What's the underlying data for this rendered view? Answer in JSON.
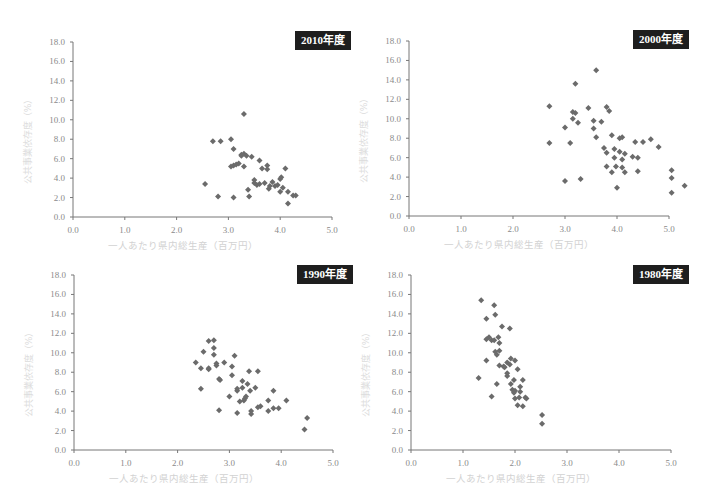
{
  "chart_data": [
    {
      "type": "scatter",
      "title": "2010年度",
      "xlabel": "一人あたり県内総生産（百万円）",
      "ylabel": "公共事業依存度（%）",
      "xlim": [
        0,
        5
      ],
      "ylim": [
        0,
        18
      ],
      "xticks": [
        "0.0",
        "1.0",
        "2.0",
        "3.0",
        "4.0",
        "5.0"
      ],
      "yticks": [
        "0.0",
        "2.0",
        "4.0",
        "6.0",
        "8.0",
        "10.0",
        "12.0",
        "14.0",
        "16.0",
        "18.0"
      ],
      "grid": false,
      "points": [
        [
          2.55,
          3.4
        ],
        [
          2.7,
          7.8
        ],
        [
          2.8,
          2.1
        ],
        [
          2.85,
          7.8
        ],
        [
          3.05,
          8.0
        ],
        [
          3.05,
          5.2
        ],
        [
          3.1,
          5.3
        ],
        [
          3.1,
          7.0
        ],
        [
          3.1,
          2.0
        ],
        [
          3.15,
          5.4
        ],
        [
          3.2,
          5.5
        ],
        [
          3.25,
          6.4
        ],
        [
          3.25,
          6.3
        ],
        [
          3.3,
          5.2
        ],
        [
          3.3,
          10.6
        ],
        [
          3.3,
          6.5
        ],
        [
          3.35,
          6.3
        ],
        [
          3.38,
          2.8
        ],
        [
          3.4,
          2.1
        ],
        [
          3.45,
          6.2
        ],
        [
          3.5,
          3.8
        ],
        [
          3.5,
          3.5
        ],
        [
          3.55,
          3.3
        ],
        [
          3.6,
          5.8
        ],
        [
          3.6,
          3.4
        ],
        [
          3.65,
          5.0
        ],
        [
          3.7,
          3.5
        ],
        [
          3.75,
          5.3
        ],
        [
          3.75,
          4.9
        ],
        [
          3.78,
          2.9
        ],
        [
          3.8,
          3.2
        ],
        [
          3.85,
          3.6
        ],
        [
          3.9,
          3.2
        ],
        [
          3.95,
          3.3
        ],
        [
          4.0,
          3.9
        ],
        [
          4.0,
          2.6
        ],
        [
          4.02,
          4.1
        ],
        [
          4.05,
          3.0
        ],
        [
          4.1,
          5.0
        ],
        [
          4.15,
          2.6
        ],
        [
          4.15,
          1.4
        ],
        [
          4.25,
          2.2
        ],
        [
          4.3,
          2.2
        ]
      ]
    },
    {
      "type": "scatter",
      "title": "2000年度",
      "xlabel": "一人あたり県内総生産（百万円）",
      "ylabel": "公共事業依存度（%）",
      "xlim": [
        0,
        5
      ],
      "ylim": [
        0,
        18
      ],
      "xticks": [
        "0.0",
        "1.0",
        "2.0",
        "3.0",
        "4.0",
        "5.0"
      ],
      "yticks": [
        "0.0",
        "2.0",
        "4.0",
        "6.0",
        "8.0",
        "10.0",
        "12.0",
        "14.0",
        "16.0",
        "18.0"
      ],
      "grid": false,
      "points": [
        [
          2.7,
          11.3
        ],
        [
          2.7,
          7.5
        ],
        [
          3.0,
          9.1
        ],
        [
          3.0,
          3.6
        ],
        [
          3.1,
          7.5
        ],
        [
          3.15,
          10.7
        ],
        [
          3.15,
          10.0
        ],
        [
          3.2,
          13.6
        ],
        [
          3.2,
          10.6
        ],
        [
          3.25,
          9.6
        ],
        [
          3.3,
          3.8
        ],
        [
          3.45,
          11.1
        ],
        [
          3.55,
          9.8
        ],
        [
          3.55,
          9.0
        ],
        [
          3.6,
          8.1
        ],
        [
          3.6,
          15.0
        ],
        [
          3.7,
          9.7
        ],
        [
          3.75,
          7.0
        ],
        [
          3.8,
          11.2
        ],
        [
          3.8,
          6.5
        ],
        [
          3.85,
          10.8
        ],
        [
          3.8,
          5.1
        ],
        [
          3.9,
          8.3
        ],
        [
          3.9,
          4.5
        ],
        [
          3.95,
          6.9
        ],
        [
          3.95,
          6.0
        ],
        [
          3.98,
          5.1
        ],
        [
          4.0,
          2.9
        ],
        [
          4.05,
          8.0
        ],
        [
          4.05,
          6.6
        ],
        [
          4.1,
          8.1
        ],
        [
          4.1,
          5.0
        ],
        [
          4.1,
          5.8
        ],
        [
          4.15,
          6.4
        ],
        [
          4.15,
          4.5
        ],
        [
          4.3,
          6.1
        ],
        [
          4.35,
          7.6
        ],
        [
          4.4,
          6.0
        ],
        [
          4.4,
          4.6
        ],
        [
          4.5,
          7.6
        ],
        [
          4.65,
          7.9
        ],
        [
          4.8,
          7.1
        ],
        [
          5.05,
          4.7
        ],
        [
          5.05,
          3.9
        ],
        [
          5.05,
          2.4
        ],
        [
          5.3,
          3.1
        ]
      ]
    },
    {
      "type": "scatter",
      "title": "1990年度",
      "xlabel": "一人あたり県内総生産（百万円）",
      "ylabel": "公共事業依存度（%）",
      "xlim": [
        0,
        5
      ],
      "ylim": [
        0,
        18
      ],
      "xticks": [
        "0.0",
        "1.0",
        "2.0",
        "3.0",
        "4.0",
        "5.0"
      ],
      "yticks": [
        "0.0",
        "2.0",
        "4.0",
        "6.0",
        "8.0",
        "10.0",
        "12.0",
        "14.0",
        "16.0",
        "18.0"
      ],
      "grid": false,
      "points": [
        [
          2.35,
          9.0
        ],
        [
          2.45,
          8.4
        ],
        [
          2.45,
          6.3
        ],
        [
          2.5,
          10.1
        ],
        [
          2.6,
          11.2
        ],
        [
          2.6,
          8.3
        ],
        [
          2.6,
          8.4
        ],
        [
          2.7,
          11.3
        ],
        [
          2.7,
          10.5
        ],
        [
          2.7,
          9.8
        ],
        [
          2.75,
          8.9
        ],
        [
          2.75,
          8.7
        ],
        [
          2.8,
          7.3
        ],
        [
          2.82,
          7.2
        ],
        [
          2.8,
          4.1
        ],
        [
          2.9,
          9.0
        ],
        [
          3.0,
          5.5
        ],
        [
          3.05,
          8.6
        ],
        [
          3.05,
          7.7
        ],
        [
          3.1,
          9.7
        ],
        [
          3.15,
          6.1
        ],
        [
          3.15,
          6.3
        ],
        [
          3.15,
          3.8
        ],
        [
          3.2,
          5.0
        ],
        [
          3.25,
          7.1
        ],
        [
          3.25,
          6.4
        ],
        [
          3.28,
          5.1
        ],
        [
          3.3,
          5.3
        ],
        [
          3.32,
          5.5
        ],
        [
          3.35,
          6.8
        ],
        [
          3.38,
          8.1
        ],
        [
          3.4,
          6.1
        ],
        [
          3.42,
          4.0
        ],
        [
          3.42,
          3.7
        ],
        [
          3.5,
          6.4
        ],
        [
          3.55,
          8.1
        ],
        [
          3.55,
          4.4
        ],
        [
          3.6,
          4.5
        ],
        [
          3.75,
          5.1
        ],
        [
          3.75,
          4.0
        ],
        [
          3.85,
          6.1
        ],
        [
          3.85,
          4.3
        ],
        [
          3.95,
          4.3
        ],
        [
          4.1,
          5.1
        ],
        [
          4.45,
          2.1
        ],
        [
          4.5,
          3.3
        ]
      ]
    },
    {
      "type": "scatter",
      "title": "1980年度",
      "xlabel": "一人あたり県内総生産（百万円）",
      "ylabel": "公共事業依存度（%）",
      "xlim": [
        0,
        5
      ],
      "ylim": [
        0,
        18
      ],
      "xticks": [
        "0.0",
        "1.0",
        "2.0",
        "3.0",
        "4.0",
        "5.0"
      ],
      "yticks": [
        "0.0",
        "2.0",
        "4.0",
        "6.0",
        "8.0",
        "10.0",
        "12.0",
        "14.0",
        "16.0",
        "18.0"
      ],
      "grid": false,
      "points": [
        [
          1.3,
          7.4
        ],
        [
          1.35,
          15.4
        ],
        [
          1.45,
          13.5
        ],
        [
          1.45,
          11.4
        ],
        [
          1.45,
          9.2
        ],
        [
          1.5,
          11.6
        ],
        [
          1.55,
          11.3
        ],
        [
          1.55,
          5.5
        ],
        [
          1.6,
          14.9
        ],
        [
          1.6,
          11.3
        ],
        [
          1.62,
          13.9
        ],
        [
          1.62,
          10.1
        ],
        [
          1.65,
          9.8
        ],
        [
          1.65,
          6.8
        ],
        [
          1.68,
          11.6
        ],
        [
          1.7,
          11.0
        ],
        [
          1.7,
          10.2
        ],
        [
          1.7,
          8.7
        ],
        [
          1.75,
          12.7
        ],
        [
          1.78,
          8.6
        ],
        [
          1.8,
          8.5
        ],
        [
          1.85,
          9.0
        ],
        [
          1.85,
          7.9
        ],
        [
          1.85,
          7.6
        ],
        [
          1.9,
          12.5
        ],
        [
          1.9,
          8.8
        ],
        [
          1.92,
          9.4
        ],
        [
          1.92,
          6.8
        ],
        [
          1.95,
          6.2
        ],
        [
          1.98,
          7.2
        ],
        [
          1.98,
          5.9
        ],
        [
          2.0,
          9.2
        ],
        [
          2.0,
          6.1
        ],
        [
          2.0,
          5.3
        ],
        [
          2.05,
          8.3
        ],
        [
          2.05,
          4.6
        ],
        [
          2.08,
          5.4
        ],
        [
          2.1,
          6.5
        ],
        [
          2.1,
          6.0
        ],
        [
          2.15,
          7.2
        ],
        [
          2.15,
          4.5
        ],
        [
          2.2,
          5.4
        ],
        [
          2.22,
          5.3
        ],
        [
          2.52,
          3.6
        ],
        [
          2.52,
          2.7
        ]
      ]
    }
  ],
  "panels": [
    {
      "badge": "2010年度",
      "xlabel": "一人あたり県内総生産（百万円）",
      "ylabel": "公共事業依存度（%）"
    },
    {
      "badge": "2000年度",
      "xlabel": "一人あたり県内総生産（百万円）",
      "ylabel": "公共事業依存度（%）"
    },
    {
      "badge": "1990年度",
      "xlabel": "一人あたり県内総生産（百万円）",
      "ylabel": "公共事業依存度（%）"
    },
    {
      "badge": "1980年度",
      "xlabel": "一人あたり県内総生産（百万円）",
      "ylabel": "公共事業依存度（%）"
    }
  ],
  "colors": {
    "marker": "#6b6b6b",
    "badge_bg": "#1e1e1e",
    "badge_text": "#ffffff",
    "axis": "#777777",
    "tick_text": "#8a8a8a"
  }
}
